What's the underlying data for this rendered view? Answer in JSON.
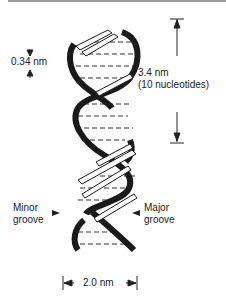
{
  "figure": {
    "labels": {
      "base_spacing": "0.34 nm",
      "pitch_value": "3.4 nm",
      "pitch_note": "(10 nucleotides)",
      "minor_groove_line1": "Minor",
      "minor_groove_line2": "groove",
      "major_groove_line1": "Major",
      "major_groove_line2": "groove",
      "diameter": "2.0 nm"
    },
    "colors": {
      "strand": "#1a1a1a",
      "base_pair": "#333333",
      "border": "#9a9a9a"
    }
  }
}
